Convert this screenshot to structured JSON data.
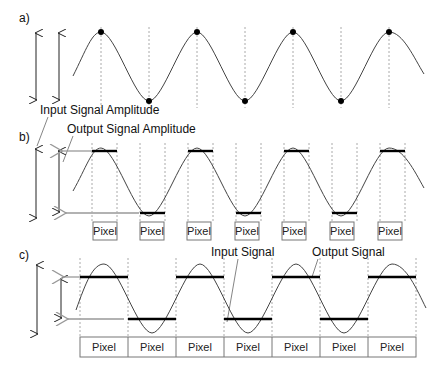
{
  "panels": {
    "a": {
      "label": "a)"
    },
    "b": {
      "label": "b)",
      "annotations": {
        "input_amplitude": "Input Signal Amplitude",
        "output_amplitude": "Output Signal Amplitude"
      },
      "pixel_label": "Pixel",
      "pixel_count": 7
    },
    "c": {
      "label": "c)",
      "annotations": {
        "input_signal": "Input Signal",
        "output_signal": "Output Signal"
      },
      "pixel_label": "Pixel",
      "pixel_count": 7
    }
  },
  "colors": {
    "signal": "#444444",
    "output": "#000000",
    "arrow_gray": "#999999",
    "grid": "#aaaaaa"
  }
}
